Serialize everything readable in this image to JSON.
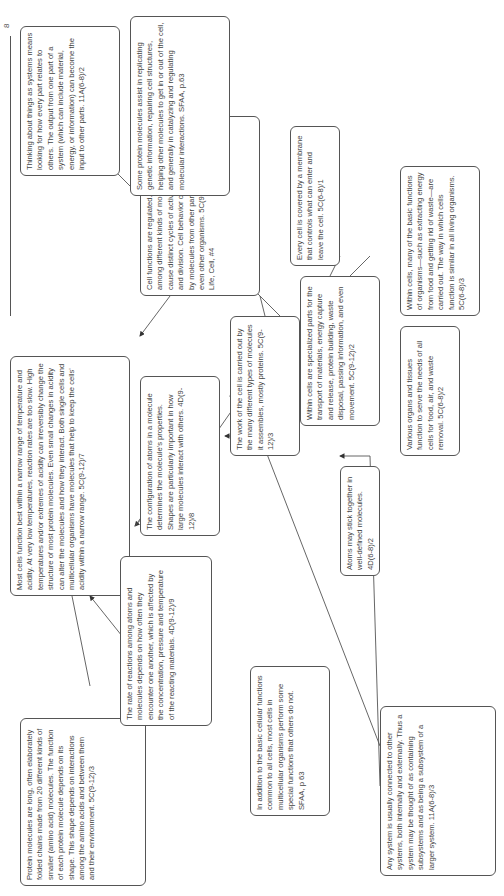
{
  "page": {
    "page_number": "8"
  },
  "nodes": [
    {
      "id": "protein_chains",
      "text": "Protein molecules are long, often elaborately folded chains made from 20 different kinds of smaller (amino acid) molecules. The function of each protein molecule depends on its shape. This shape depends on interactions among the amino acids and between them and their environment. 5C(9-12)/3"
    },
    {
      "id": "narrow_range",
      "text": "Most cells function best within a narrow range of temperature and acidity. At very low temperatures, reaction rates are too slow. High temperatures and/or extremes of acidity can irreversibly change the structure of most protein molecules. Even small changes in acidity can alter the molecules and how they interact. Both single cells and multicellular organisms have molecules that help to keep the cells' acidity within a narrow range. 5C(9-12)/7"
    },
    {
      "id": "rate_reactions",
      "text": "The rate of reactions among atoms and molecules depends on how often they encounter one another, which is affected by the concentration, pressure and temperature of the reacting materials. 4D(9-12)/9"
    },
    {
      "id": "basic_functions",
      "text": "In addition to the basic cellular functions common to all cells, most cells in multicellular organisms perform some special functions that others do not. SFAA, p 63"
    },
    {
      "id": "configuration",
      "text": "The configuration of atoms in a molecule determines the molecule's properties. Shapes are particularly important in how large molecules interact with others. 4D(9-12)/8"
    },
    {
      "id": "any_system",
      "text": "Any system is usually connected to other systems, both internally and externally. Thus a system may be thought of as containing subsystems and as being a subsystem of a larger system. 11A(6-8)/3"
    },
    {
      "id": "work_of_cell",
      "text": "The work of the cell is carried out by the many different types of molecules it assembles, mostly proteins. 5C(9-12)/3"
    },
    {
      "id": "regulated",
      "text": "Cell functions are regulated. Complex interactions among different kinds of molecules in the cell cause distinct cycles of activities, such as growth and division. Cell behavior can also be affected by molecules from other parts of the organism or even other organisms. 5C(9-12)/5 NSES, 9-12, Life, Cell, #4"
    },
    {
      "id": "atoms_stick",
      "text": "Atoms may stick together in well-defined molecules. 4D(6-8)/2"
    },
    {
      "id": "specialized_parts",
      "text": "Within cells are specialized parts for the transport of materials, energy capture and release, protein building, waste disposal, passing information, and even movement. 5C(9-12)/2"
    },
    {
      "id": "membrane",
      "text": "Every cell is covered by a membrane that controls what can enter and leave the cell. 5C(6-8)/1"
    },
    {
      "id": "organs_tissues",
      "text": "Various organs and tissues function to serve the needs of all cells for food, air, and waste removal. 5C(6-8)/2"
    },
    {
      "id": "within_cells_basic",
      "text": "Within cells, many of the basic functions of organisms—such as extracting energy from food and getting rid of waste—are carried out. The way in which cells function is similar in all living organisms. 5C(6-8)/3"
    },
    {
      "id": "protein_assist",
      "text": "Some protein molecules assist in replicating genetic information, repairing cell structures, helping other molecules to get in or out of the cell, and generally in catalyzing and regulating molecular interactions. SFAA, p.63"
    },
    {
      "id": "systems_thinking",
      "text": "Thinking about things as systems means looking for how every part relates to others. The output from one part of a system (which can include material, energy, or information) can become the input to other parts. 11A(6-8)/2"
    }
  ]
}
